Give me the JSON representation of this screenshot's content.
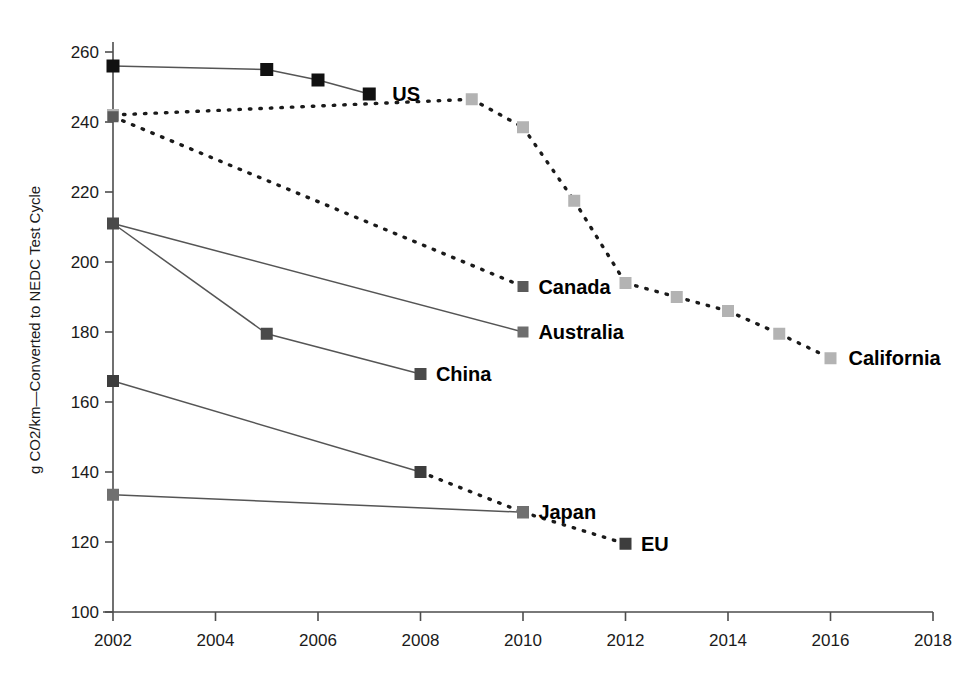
{
  "chart_data": {
    "type": "line",
    "title": "",
    "subtitle": "",
    "xlabel": "",
    "ylabel": "g CO2/km—Converted to NEDC Test Cycle",
    "xlim": [
      2002,
      2018
    ],
    "ylim": [
      100,
      260
    ],
    "xticks": [
      2002,
      2004,
      2006,
      2008,
      2010,
      2012,
      2014,
      2016,
      2018
    ],
    "yticks": [
      100,
      120,
      140,
      160,
      180,
      200,
      220,
      240,
      260
    ],
    "xtick_labels": [
      "2002",
      "2004",
      "2006",
      "2008",
      "2010",
      "2012",
      "2014",
      "2016",
      "2018"
    ],
    "ytick_labels": [
      "100",
      "120",
      "140",
      "160",
      "180",
      "200",
      "220",
      "240",
      "260"
    ],
    "grid": false,
    "legend_position": "inline-end-of-line",
    "series": [
      {
        "name": "US",
        "label": "US",
        "color": "#111111",
        "marker": "square",
        "marker_size": 13,
        "line_style": "solid",
        "label_x": 2007.45,
        "label_y": 248.0,
        "points": [
          {
            "x": 2002,
            "y": 256.0,
            "style": "solid"
          },
          {
            "x": 2005,
            "y": 255.0,
            "style": "solid"
          },
          {
            "x": 2006,
            "y": 252.0,
            "style": "solid"
          },
          {
            "x": 2007,
            "y": 248.0,
            "style": "solid"
          }
        ]
      },
      {
        "name": "California",
        "label": "California",
        "color": "#b3b3b3",
        "marker": "square",
        "marker_size": 12,
        "line_style": "mixed",
        "label_x": 2016.35,
        "label_y": 172.5,
        "points": [
          {
            "x": 2002,
            "y": 242.0,
            "style": "solid"
          },
          {
            "x": 2009,
            "y": 246.5,
            "style": "dashed"
          },
          {
            "x": 2010,
            "y": 238.5,
            "style": "dashed"
          },
          {
            "x": 2011,
            "y": 217.5,
            "style": "dashed"
          },
          {
            "x": 2012,
            "y": 194.0,
            "style": "dashed"
          },
          {
            "x": 2013,
            "y": 190.0,
            "style": "dashed"
          },
          {
            "x": 2014,
            "y": 186.0,
            "style": "dashed"
          },
          {
            "x": 2015,
            "y": 179.5,
            "style": "dashed"
          },
          {
            "x": 2016,
            "y": 172.5,
            "style": "dashed"
          }
        ]
      },
      {
        "name": "Canada",
        "label": "Canada",
        "color": "#5a5a5a",
        "marker": "square",
        "marker_size": 11,
        "line_style": "dashed",
        "label_x": 2010.3,
        "label_y": 193.0,
        "points": [
          {
            "x": 2002,
            "y": 241.5,
            "style": "dashed"
          },
          {
            "x": 2010,
            "y": 193.0,
            "style": "dashed"
          }
        ]
      },
      {
        "name": "Australia",
        "label": "Australia",
        "color": "#6e6e6e",
        "marker": "square",
        "marker_size": 11,
        "line_style": "solid",
        "label_x": 2010.3,
        "label_y": 180.0,
        "points": [
          {
            "x": 2002,
            "y": 211.0,
            "style": "solid"
          },
          {
            "x": 2010,
            "y": 180.0,
            "style": "solid"
          }
        ]
      },
      {
        "name": "China",
        "label": "China",
        "color": "#4a4a4a",
        "marker": "square",
        "marker_size": 12,
        "line_style": "solid",
        "label_x": 2008.3,
        "label_y": 168.0,
        "points": [
          {
            "x": 2002,
            "y": 211.0,
            "style": "solid"
          },
          {
            "x": 2005,
            "y": 179.5,
            "style": "solid"
          },
          {
            "x": 2008,
            "y": 168.0,
            "style": "solid"
          }
        ]
      },
      {
        "name": "EU",
        "label": "EU",
        "color": "#3d3d3d",
        "marker": "square",
        "marker_size": 12,
        "line_style": "mixed",
        "label_x": 2012.3,
        "label_y": 119.5,
        "points": [
          {
            "x": 2002,
            "y": 166.0,
            "style": "solid"
          },
          {
            "x": 2008,
            "y": 140.0,
            "style": "solid"
          },
          {
            "x": 2010,
            "y": 128.5,
            "style": "dashed"
          },
          {
            "x": 2012,
            "y": 119.5,
            "style": "dashed"
          }
        ]
      },
      {
        "name": "Japan",
        "label": "Japan",
        "color": "#707070",
        "marker": "square",
        "marker_size": 12,
        "line_style": "solid",
        "label_x": 2010.3,
        "label_y": 128.5,
        "points": [
          {
            "x": 2002,
            "y": 133.5,
            "style": "solid"
          },
          {
            "x": 2010,
            "y": 128.5,
            "style": "solid"
          }
        ]
      }
    ]
  },
  "axis": {
    "y_title": "g CO2/km—Converted to NEDC Test Cycle",
    "axis_color": "#4d4d4d"
  }
}
